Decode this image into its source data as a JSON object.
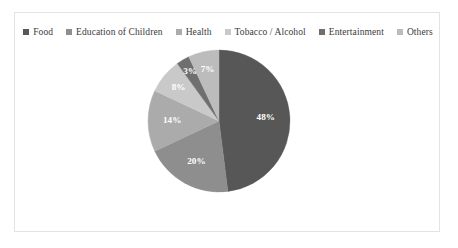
{
  "chart_data": {
    "type": "pie",
    "title": "",
    "legend_position": "top",
    "categories": [
      "Food",
      "Education of Children",
      "Health",
      "Tobacco / Alcohol",
      "Entertainment",
      "Others"
    ],
    "values": [
      48,
      20,
      14,
      8,
      3,
      7
    ],
    "value_labels": [
      "48%",
      "20%",
      "14%",
      "8%",
      "3%",
      "7%"
    ],
    "units": "percent",
    "total": 100,
    "start_angle_deg": 0,
    "direction": "clockwise",
    "colors": [
      "#575757",
      "#8e8e8e",
      "#ababab",
      "#c9c9c9",
      "#6f6f6f",
      "#bcbcbc"
    ],
    "label_color": "#ffffff"
  },
  "legend": {
    "items": [
      {
        "label": "Food",
        "color": "#575757"
      },
      {
        "label": "Education of Children",
        "color": "#8e8e8e"
      },
      {
        "label": "Health",
        "color": "#ababab"
      },
      {
        "label": "Tobacco / Alcohol",
        "color": "#c9c9c9"
      },
      {
        "label": "Entertainment",
        "color": "#6f6f6f"
      },
      {
        "label": "Others",
        "color": "#bcbcbc"
      }
    ]
  },
  "frame": {
    "border_color": "#e3e3e3",
    "background": "#ffffff"
  }
}
